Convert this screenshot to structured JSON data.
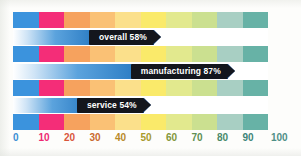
{
  "chart_data": {
    "type": "bar",
    "title": "",
    "xlabel": "",
    "ylabel": "",
    "orientation": "horizontal",
    "xlim": [
      0,
      100
    ],
    "grid": false,
    "legend": "none",
    "categories": [
      "overall",
      "manufacturing",
      "service"
    ],
    "values": [
      58,
      87,
      54
    ],
    "value_unit": "%",
    "data_labels": [
      "overall 58%",
      "manufacturing 87%",
      "service 54%"
    ],
    "axis_ticks": [
      {
        "value": 0,
        "label": "0",
        "color": "#3a8fd4"
      },
      {
        "value": 10,
        "label": "10",
        "color": "#ee2a72"
      },
      {
        "value": 20,
        "label": "20",
        "color": "#d9563b"
      },
      {
        "value": 30,
        "label": "30",
        "color": "#c96a2e"
      },
      {
        "value": 40,
        "label": "40",
        "color": "#b98a2a"
      },
      {
        "value": 50,
        "label": "50",
        "color": "#a89a2c"
      },
      {
        "value": 60,
        "label": "60",
        "color": "#83963a"
      },
      {
        "value": 70,
        "label": "70",
        "color": "#5f8f52"
      },
      {
        "value": 80,
        "label": "80",
        "color": "#4a8a6a"
      },
      {
        "value": 90,
        "label": "90",
        "color": "#3d8578"
      },
      {
        "value": 100,
        "label": "100",
        "color": "#4f8f86"
      }
    ],
    "background_bands": [
      {
        "range": [
          0,
          10
        ],
        "color": "#3b93dd"
      },
      {
        "range": [
          10,
          20
        ],
        "color": "#f42d78"
      },
      {
        "range": [
          20,
          30
        ],
        "color": "#f6a25e"
      },
      {
        "range": [
          30,
          40
        ],
        "color": "#fac175"
      },
      {
        "range": [
          40,
          50
        ],
        "color": "#fbe08b"
      },
      {
        "range": [
          50,
          60
        ],
        "color": "#faea6a"
      },
      {
        "range": [
          60,
          70
        ],
        "color": "#e2e98e"
      },
      {
        "range": [
          70,
          80
        ],
        "color": "#cbe090"
      },
      {
        "range": [
          80,
          90
        ],
        "color": "#a8cfc3"
      },
      {
        "range": [
          90,
          100
        ],
        "color": "#67b2a6"
      }
    ],
    "bar_fill_gradient": [
      "#ffffff",
      "#5ba3dd",
      "#17457f"
    ],
    "flag_color": "#14161d",
    "flag_text_color": "#ffffff"
  }
}
